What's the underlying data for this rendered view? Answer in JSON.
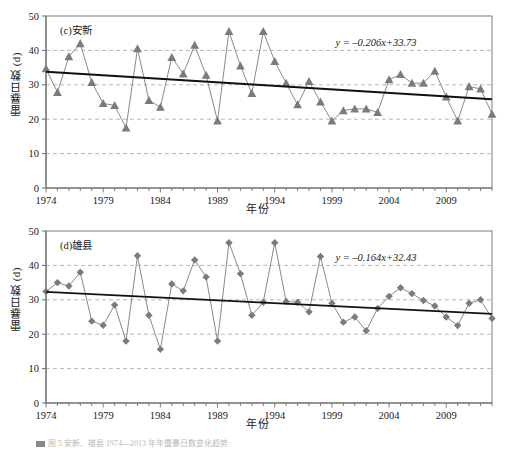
{
  "figure": {
    "caption": "图 5  安新、雄县 1974—2013 年年雷暴日数变化趋势"
  },
  "axis": {
    "ylabel": "雷暴日数 (d)",
    "xlabel": "年份",
    "y_ticks": [
      "0",
      "10",
      "20",
      "30",
      "40",
      "50"
    ],
    "x_ticks": [
      "1974",
      "1979",
      "1984",
      "1989",
      "1994",
      "1999",
      "2004",
      "2009"
    ]
  },
  "style": {
    "marker_color": "#7b7b7b",
    "line_color": "#8a8a8a",
    "trend_color": "#111111",
    "grid_color": "#9a9a9a",
    "axis_color": "#6d6d6d"
  },
  "chart_data": [
    {
      "type": "line",
      "panel": "c",
      "title": "(c)安新",
      "xlabel": "年份",
      "ylabel": "雷暴日数 (d)",
      "xlim": [
        1974,
        2013
      ],
      "ylim": [
        0,
        50
      ],
      "grid": true,
      "marker": "triangle",
      "annotation": "y = –0.206x+33.73",
      "trend": {
        "slope": -0.206,
        "intercept": 33.73,
        "y_start": 33.8,
        "y_end": 25.8
      },
      "x": [
        1974,
        1975,
        1976,
        1977,
        1978,
        1979,
        1980,
        1981,
        1982,
        1983,
        1984,
        1985,
        1986,
        1987,
        1988,
        1989,
        1990,
        1991,
        1992,
        1993,
        1994,
        1995,
        1996,
        1997,
        1998,
        1999,
        2000,
        2001,
        2002,
        2003,
        2004,
        2005,
        2006,
        2007,
        2008,
        2009,
        2010,
        2011,
        2012,
        2013
      ],
      "values": [
        34.7,
        27.8,
        38.2,
        42.0,
        30.7,
        24.6,
        24.0,
        17.5,
        40.5,
        25.5,
        23.5,
        38.0,
        33.2,
        41.5,
        32.8,
        19.5,
        45.5,
        35.5,
        27.5,
        45.5,
        36.8,
        30.5,
        24.2,
        31.0,
        25.0,
        19.5,
        22.5,
        23.0,
        23.0,
        22.0,
        31.5,
        33.0,
        30.5,
        30.5,
        34.0,
        26.5,
        19.5,
        29.5,
        28.8,
        21.5
      ]
    },
    {
      "type": "line",
      "panel": "d",
      "title": "(d)雄县",
      "xlabel": "年份",
      "ylabel": "雷暴日数 (d)",
      "xlim": [
        1974,
        2013
      ],
      "ylim": [
        0,
        50
      ],
      "grid": true,
      "marker": "diamond",
      "annotation": "y = –0.164x+32.43",
      "trend": {
        "slope": -0.164,
        "intercept": 32.43,
        "y_start": 32.3,
        "y_end": 25.9
      },
      "x": [
        1974,
        1975,
        1976,
        1977,
        1978,
        1979,
        1980,
        1981,
        1982,
        1983,
        1984,
        1985,
        1986,
        1987,
        1988,
        1989,
        1990,
        1991,
        1992,
        1993,
        1994,
        1995,
        1996,
        1997,
        1998,
        1999,
        2000,
        2001,
        2002,
        2003,
        2004,
        2005,
        2006,
        2007,
        2008,
        2009,
        2010,
        2011,
        2012,
        2013
      ],
      "values": [
        32.4,
        35.0,
        34.0,
        38.0,
        23.8,
        22.6,
        28.5,
        18.0,
        42.8,
        25.5,
        15.6,
        34.6,
        32.6,
        41.6,
        36.6,
        18.0,
        46.6,
        37.6,
        25.5,
        29.3,
        46.6,
        29.5,
        29.3,
        26.5,
        42.6,
        29.0,
        23.5,
        25.0,
        21.0,
        27.5,
        31.0,
        33.5,
        31.8,
        29.8,
        28.2,
        25.0,
        22.5,
        29.0,
        30.0,
        24.6
      ]
    }
  ]
}
